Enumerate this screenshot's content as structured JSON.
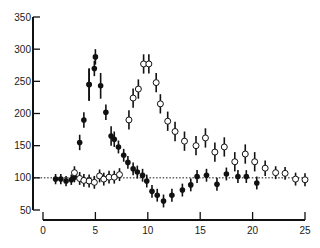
{
  "chart_data": {
    "type": "scatter",
    "title": "",
    "xlabel": "",
    "ylabel": "",
    "xlim": [
      0,
      25
    ],
    "ylim": [
      50,
      350
    ],
    "x_ticks": [
      0,
      5,
      10,
      15,
      20,
      25
    ],
    "y_ticks": [
      50,
      100,
      150,
      200,
      250,
      300,
      350
    ],
    "x_tick_labels": [
      "0",
      "5",
      "10",
      "15",
      "20",
      "25"
    ],
    "y_tick_labels": [
      "50",
      "100",
      "150",
      "200",
      "250",
      "300",
      "350"
    ],
    "grid": false,
    "legend": null,
    "reference_line": {
      "y": 100,
      "style": "dotted"
    },
    "series": [
      {
        "name": "filled",
        "marker": "filled-circle",
        "color": "#000000",
        "points": [
          {
            "x": 1.2,
            "y": 98,
            "err": 8
          },
          {
            "x": 1.7,
            "y": 98,
            "err": 8
          },
          {
            "x": 2.2,
            "y": 95,
            "err": 8
          },
          {
            "x": 2.7,
            "y": 97,
            "err": 8
          },
          {
            "x": 3.0,
            "y": 101,
            "err": 8
          },
          {
            "x": 3.5,
            "y": 155,
            "err": 12
          },
          {
            "x": 3.9,
            "y": 190,
            "err": 12
          },
          {
            "x": 4.4,
            "y": 245,
            "err": 25
          },
          {
            "x": 4.4,
            "y": 245,
            "err": 25
          },
          {
            "x": 4.9,
            "y": 270,
            "err": 12
          },
          {
            "x": 5.0,
            "y": 288,
            "err": 12
          },
          {
            "x": 5.5,
            "y": 243,
            "err": 20
          },
          {
            "x": 6.0,
            "y": 202,
            "err": 12
          },
          {
            "x": 6.5,
            "y": 165,
            "err": 15
          },
          {
            "x": 6.8,
            "y": 160,
            "err": 12
          },
          {
            "x": 7.2,
            "y": 148,
            "err": 10
          },
          {
            "x": 7.7,
            "y": 135,
            "err": 10
          },
          {
            "x": 8.1,
            "y": 124,
            "err": 10
          },
          {
            "x": 8.6,
            "y": 114,
            "err": 10
          },
          {
            "x": 9.0,
            "y": 109,
            "err": 10
          },
          {
            "x": 9.5,
            "y": 104,
            "err": 10
          },
          {
            "x": 9.9,
            "y": 95,
            "err": 10
          },
          {
            "x": 10.4,
            "y": 79,
            "err": 10
          },
          {
            "x": 10.9,
            "y": 73,
            "err": 10
          },
          {
            "x": 11.5,
            "y": 64,
            "err": 10
          },
          {
            "x": 12.3,
            "y": 73,
            "err": 10
          },
          {
            "x": 13.3,
            "y": 81,
            "err": 10
          },
          {
            "x": 14.1,
            "y": 89,
            "err": 10
          },
          {
            "x": 14.7,
            "y": 102,
            "err": 10
          },
          {
            "x": 15.6,
            "y": 104,
            "err": 10
          },
          {
            "x": 16.6,
            "y": 90,
            "err": 10
          },
          {
            "x": 17.5,
            "y": 106,
            "err": 10
          },
          {
            "x": 18.6,
            "y": 102,
            "err": 10
          },
          {
            "x": 19.4,
            "y": 102,
            "err": 10
          },
          {
            "x": 20.4,
            "y": 92,
            "err": 10
          }
        ]
      },
      {
        "name": "open",
        "marker": "open-circle",
        "color": "#000000",
        "points": [
          {
            "x": 3.0,
            "y": 108,
            "err": 10
          },
          {
            "x": 3.5,
            "y": 99,
            "err": 10
          },
          {
            "x": 3.9,
            "y": 96,
            "err": 10
          },
          {
            "x": 4.4,
            "y": 95,
            "err": 10
          },
          {
            "x": 4.9,
            "y": 93,
            "err": 10
          },
          {
            "x": 5.4,
            "y": 103,
            "err": 10
          },
          {
            "x": 5.8,
            "y": 98,
            "err": 10
          },
          {
            "x": 6.3,
            "y": 101,
            "err": 10
          },
          {
            "x": 6.8,
            "y": 101,
            "err": 10
          },
          {
            "x": 7.3,
            "y": 105,
            "err": 10
          },
          {
            "x": 8.2,
            "y": 190,
            "err": 15
          },
          {
            "x": 8.6,
            "y": 224,
            "err": 15
          },
          {
            "x": 9.1,
            "y": 238,
            "err": 15
          },
          {
            "x": 9.6,
            "y": 277,
            "err": 15
          },
          {
            "x": 10.1,
            "y": 277,
            "err": 15
          },
          {
            "x": 10.8,
            "y": 248,
            "err": 15
          },
          {
            "x": 11.2,
            "y": 215,
            "err": 15
          },
          {
            "x": 11.9,
            "y": 188,
            "err": 15
          },
          {
            "x": 12.6,
            "y": 172,
            "err": 15
          },
          {
            "x": 13.5,
            "y": 157,
            "err": 15
          },
          {
            "x": 14.6,
            "y": 150,
            "err": 15
          },
          {
            "x": 15.5,
            "y": 162,
            "err": 15
          },
          {
            "x": 16.4,
            "y": 140,
            "err": 15
          },
          {
            "x": 17.3,
            "y": 148,
            "err": 15
          },
          {
            "x": 18.3,
            "y": 125,
            "err": 15
          },
          {
            "x": 19.3,
            "y": 137,
            "err": 15
          },
          {
            "x": 20.2,
            "y": 125,
            "err": 15
          },
          {
            "x": 21.2,
            "y": 115,
            "err": 12
          },
          {
            "x": 22.2,
            "y": 108,
            "err": 10
          },
          {
            "x": 23.1,
            "y": 107,
            "err": 10
          },
          {
            "x": 24.1,
            "y": 98,
            "err": 10
          },
          {
            "x": 25.0,
            "y": 97,
            "err": 10
          }
        ]
      }
    ]
  },
  "style": {
    "ink": "#111111",
    "background": "#ffffff"
  }
}
